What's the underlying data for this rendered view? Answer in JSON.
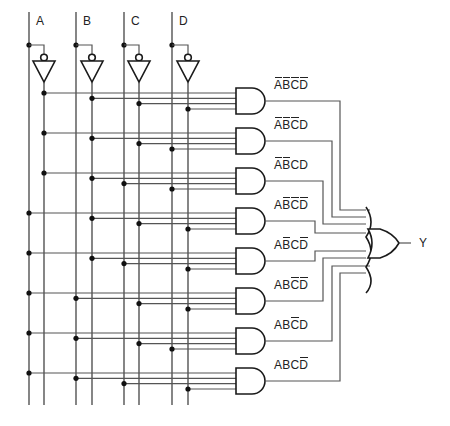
{
  "diagram": {
    "title": "",
    "type": "combinational logic circuit (sum of minterms)",
    "inputs": [
      {
        "name": "A",
        "x": 29,
        "inv_x": 44
      },
      {
        "name": "B",
        "x": 76,
        "inv_x": 92
      },
      {
        "name": "C",
        "x": 124,
        "inv_x": 139
      },
      {
        "name": "D",
        "x": 172,
        "inv_x": 188
      }
    ],
    "output": {
      "name": "Y"
    },
    "and_gates": [
      {
        "label": "ĀB̄C̄D̄",
        "terms": [
          {
            "v": "A",
            "neg": true
          },
          {
            "v": "B",
            "neg": true
          },
          {
            "v": "C",
            "neg": true
          },
          {
            "v": "D",
            "neg": true
          }
        ]
      },
      {
        "label": "ĀB̄C̄D",
        "terms": [
          {
            "v": "A",
            "neg": true
          },
          {
            "v": "B",
            "neg": true
          },
          {
            "v": "C",
            "neg": true
          },
          {
            "v": "D",
            "neg": false
          }
        ]
      },
      {
        "label": "ĀB̄CD",
        "terms": [
          {
            "v": "A",
            "neg": true
          },
          {
            "v": "B",
            "neg": true
          },
          {
            "v": "C",
            "neg": false
          },
          {
            "v": "D",
            "neg": false
          }
        ]
      },
      {
        "label": "AB̄C̄D̄",
        "terms": [
          {
            "v": "A",
            "neg": false
          },
          {
            "v": "B",
            "neg": true
          },
          {
            "v": "C",
            "neg": true
          },
          {
            "v": "D",
            "neg": true
          }
        ]
      },
      {
        "label": "AB̄CD̄",
        "terms": [
          {
            "v": "A",
            "neg": false
          },
          {
            "v": "B",
            "neg": true
          },
          {
            "v": "C",
            "neg": false
          },
          {
            "v": "D",
            "neg": true
          }
        ]
      },
      {
        "label": "ABC̄D̄",
        "terms": [
          {
            "v": "A",
            "neg": false
          },
          {
            "v": "B",
            "neg": false
          },
          {
            "v": "C",
            "neg": true
          },
          {
            "v": "D",
            "neg": true
          }
        ]
      },
      {
        "label": "ABC̄D",
        "terms": [
          {
            "v": "A",
            "neg": false
          },
          {
            "v": "B",
            "neg": false
          },
          {
            "v": "C",
            "neg": true
          },
          {
            "v": "D",
            "neg": false
          }
        ]
      },
      {
        "label": "ABCD̄",
        "terms": [
          {
            "v": "A",
            "neg": false
          },
          {
            "v": "B",
            "neg": false
          },
          {
            "v": "C",
            "neg": false
          },
          {
            "v": "D",
            "neg": true
          }
        ]
      }
    ],
    "or_gate": {
      "inputs": 8,
      "output_label": "Y"
    },
    "expression": "Y = ĀB̄C̄D̄ + ĀB̄C̄D + ĀB̄CD + AB̄C̄D̄ + AB̄CD̄ + ABC̄D̄ + ABC̄D + ABCD̄",
    "colors": {
      "wire": "#555555",
      "gate_stroke": "#1a1a1a",
      "node": "#111111",
      "text": "#222222",
      "background": "#ffffff"
    }
  }
}
